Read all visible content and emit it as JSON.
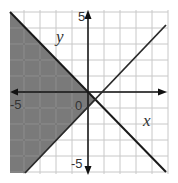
{
  "chart_data": {
    "type": "inequality-graph",
    "title": "",
    "xlabel": "x",
    "ylabel": "y",
    "xlim": [
      -5,
      5
    ],
    "ylim": [
      -5,
      5
    ],
    "grid": true,
    "grid_step": 1,
    "tick_labels": {
      "x": [
        "-5",
        "0"
      ],
      "y": [
        "5",
        "-5"
      ]
    },
    "lines": [
      {
        "name": "boundary-1",
        "equation": "y = -x",
        "slope": -1,
        "intercept": 0,
        "style": "solid"
      },
      {
        "name": "boundary-2",
        "equation": "y = x - 1",
        "slope": 1,
        "intercept": -1,
        "style": "solid"
      }
    ],
    "shaded_region": {
      "description": "left wedge: y <= -x and y >= x - 1",
      "inequalities": [
        "y <= -x",
        "y >= x - 1"
      ],
      "vertex": [
        0.5,
        -0.5
      ]
    },
    "colors": {
      "shade": "#7a7a7a",
      "grid": "#c8c8c8",
      "grid_shaded": "#666666",
      "axis": "#111111",
      "line": "#1a1a1a"
    }
  },
  "labels": {
    "x_axis": "x",
    "y_axis": "y",
    "origin": "0",
    "x_min": "-5",
    "y_max": "5",
    "y_min": "-5"
  }
}
